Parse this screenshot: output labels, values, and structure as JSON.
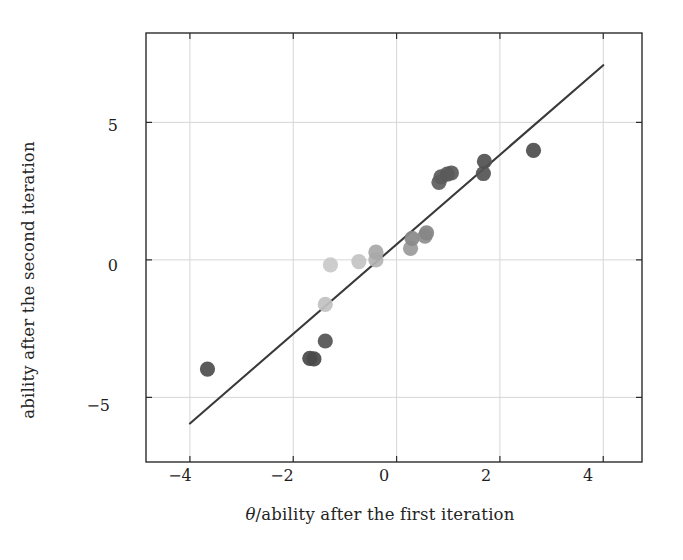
{
  "chart": {
    "type": "scatter",
    "title": "",
    "xlabel_theta": "θ",
    "xlabel_rest": "/ability after the first iteration",
    "xlabel_full": "θ/ability after the first iteration",
    "ylabel": "ability after the second iteration",
    "x_ticks": [
      "−4",
      "−2",
      "0",
      "2",
      "4"
    ],
    "y_ticks": [
      "5",
      "0",
      "−5"
    ]
  },
  "chart_data": {
    "type": "scatter",
    "title": "",
    "xlabel": "θ/ability after the first iteration",
    "ylabel": "ability after the second iteration",
    "xlim": [
      -4.85,
      4.75
    ],
    "ylim": [
      -7.35,
      8.25
    ],
    "xticks": [
      -4,
      -2,
      0,
      2,
      4
    ],
    "yticks": [
      5,
      0,
      -5
    ],
    "grid": true,
    "legend": null,
    "series": [
      {
        "name": "ability estimates",
        "marker": "circle",
        "points": [
          {
            "x": -3.66,
            "y": -3.97,
            "shade": "#4f4f4f"
          },
          {
            "x": -1.68,
            "y": -3.58,
            "shade": "#4a4a4a"
          },
          {
            "x": -1.6,
            "y": -3.6,
            "shade": "#4a4a4a"
          },
          {
            "x": -1.38,
            "y": -2.95,
            "shade": "#545454"
          },
          {
            "x": -1.38,
            "y": -1.62,
            "shade": "#c2c2c2"
          },
          {
            "x": -1.28,
            "y": -0.18,
            "shade": "#c9c9c9"
          },
          {
            "x": -0.73,
            "y": -0.06,
            "shade": "#c4c4c4"
          },
          {
            "x": -0.4,
            "y": 0.0,
            "shade": "#b4b4b4"
          },
          {
            "x": -0.4,
            "y": 0.28,
            "shade": "#a8a8a8"
          },
          {
            "x": 0.27,
            "y": 0.42,
            "shade": "#9b9b9b"
          },
          {
            "x": 0.3,
            "y": 0.78,
            "shade": "#8a8a8a"
          },
          {
            "x": 0.55,
            "y": 0.86,
            "shade": "#8f8f8f"
          },
          {
            "x": 0.58,
            "y": 0.98,
            "shade": "#858585"
          },
          {
            "x": 0.82,
            "y": 2.82,
            "shade": "#5f5f5f"
          },
          {
            "x": 0.86,
            "y": 3.02,
            "shade": "#5c5c5c"
          },
          {
            "x": 0.98,
            "y": 3.12,
            "shade": "#5a5a5a"
          },
          {
            "x": 1.06,
            "y": 3.16,
            "shade": "#5a5a5a"
          },
          {
            "x": 1.68,
            "y": 3.14,
            "shade": "#555555"
          },
          {
            "x": 1.7,
            "y": 3.58,
            "shade": "#525252"
          },
          {
            "x": 2.65,
            "y": 3.98,
            "shade": "#4d4d4d"
          }
        ]
      }
    ],
    "fit_line": {
      "name": "identity/regression line",
      "x_start": -4.0,
      "y_start": -5.95,
      "x_end": 4.0,
      "y_end": 7.08,
      "color": "#3a3a3a"
    }
  },
  "colors": {
    "axis": "#2b2b2b",
    "grid": "#d6d6d6",
    "line": "#3a3a3a",
    "text": "#1f1f1f",
    "background": "#ffffff"
  }
}
